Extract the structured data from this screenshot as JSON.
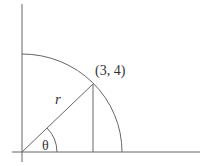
{
  "diagram": {
    "type": "polar-coordinate-illustration",
    "point_label": "(3, 4)",
    "radius_label": "r",
    "angle_label": "θ",
    "colors": {
      "stroke": "#666666",
      "text": "#333333",
      "background": "#ffffff"
    }
  }
}
